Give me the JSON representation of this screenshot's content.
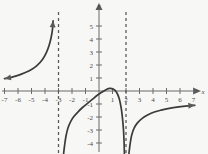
{
  "figure": {
    "kind": "cartesian-graph",
    "background_color": "#f7f7f5",
    "curve_color": "#3b3b3b",
    "axis_color": "#6b6b6b",
    "asymptote_color": "#5c5c5c"
  },
  "axes": {
    "x_name": "x",
    "y_name": "y",
    "x_ticks": [
      "-7",
      "-6",
      "-5",
      "-4",
      "-3",
      "-2",
      "-1",
      "1",
      "2",
      "3",
      "4",
      "5",
      "6",
      "7"
    ],
    "y_ticks": [
      "5",
      "4",
      "3",
      "2",
      "1",
      "-1",
      "-2",
      "-3",
      "-4"
    ]
  },
  "chart_data": {
    "type": "line",
    "title": "",
    "xlabel": "x",
    "ylabel": "y",
    "xlim": [
      -7.4,
      7.4
    ],
    "ylim": [
      -4.8,
      5.8
    ],
    "grid": false,
    "legend": "none",
    "x_tick_values": [
      -7,
      -6,
      -5,
      -4,
      -3,
      -2,
      -1,
      1,
      2,
      3,
      4,
      5,
      6,
      7
    ],
    "y_tick_values": [
      5,
      4,
      3,
      2,
      1,
      -1,
      -2,
      -3,
      -4
    ],
    "annotations": [
      {
        "text": "vertical asymptote",
        "x": -3
      },
      {
        "text": "vertical asymptote",
        "x": 2
      }
    ],
    "asymptotes": {
      "vertical": [
        -3,
        2
      ],
      "horizontal": []
    },
    "series": [
      {
        "name": "left-branch",
        "style": "solid",
        "arrow_start": true,
        "arrow_end": true,
        "points": [
          [
            -7.0,
            0.95
          ],
          [
            -6.5,
            1.05
          ],
          [
            -6.0,
            1.2
          ],
          [
            -5.5,
            1.4
          ],
          [
            -5.0,
            1.65
          ],
          [
            -4.6,
            1.95
          ],
          [
            -4.2,
            2.4
          ],
          [
            -3.9,
            2.95
          ],
          [
            -3.7,
            3.5
          ],
          [
            -3.55,
            4.1
          ],
          [
            -3.45,
            4.7
          ],
          [
            -3.4,
            5.4
          ]
        ]
      },
      {
        "name": "middle-branch",
        "style": "solid",
        "arrow_start": false,
        "arrow_end": false,
        "points": [
          [
            -2.62,
            -4.8
          ],
          [
            -2.55,
            -4.2
          ],
          [
            -2.45,
            -3.5
          ],
          [
            -2.3,
            -2.85
          ],
          [
            -2.1,
            -2.35
          ],
          [
            -1.85,
            -1.95
          ],
          [
            -1.55,
            -1.6
          ],
          [
            -1.2,
            -1.25
          ],
          [
            -0.85,
            -0.95
          ],
          [
            -0.5,
            -0.65
          ],
          [
            -0.15,
            -0.35
          ],
          [
            0.2,
            -0.1
          ],
          [
            0.55,
            0.12
          ],
          [
            0.8,
            0.2
          ],
          [
            1.05,
            0.15
          ],
          [
            1.3,
            -0.1
          ],
          [
            1.5,
            -0.6
          ],
          [
            1.65,
            -1.35
          ],
          [
            1.75,
            -2.2
          ],
          [
            1.82,
            -3.1
          ],
          [
            1.86,
            -4.0
          ],
          [
            1.88,
            -4.8
          ]
        ]
      },
      {
        "name": "right-branch",
        "style": "solid",
        "arrow_start": false,
        "arrow_end": true,
        "points": [
          [
            2.22,
            -4.8
          ],
          [
            2.3,
            -4.1
          ],
          [
            2.42,
            -3.4
          ],
          [
            2.6,
            -2.85
          ],
          [
            2.85,
            -2.45
          ],
          [
            3.2,
            -2.1
          ],
          [
            3.6,
            -1.85
          ],
          [
            4.1,
            -1.62
          ],
          [
            4.6,
            -1.47
          ],
          [
            5.2,
            -1.33
          ],
          [
            5.9,
            -1.22
          ],
          [
            6.6,
            -1.14
          ],
          [
            7.1,
            -1.1
          ]
        ]
      }
    ]
  }
}
